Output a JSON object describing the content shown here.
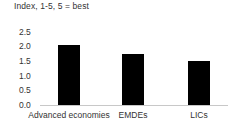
{
  "chart_data": {
    "type": "bar",
    "title": "Index, 1-5, 5 = best",
    "xlabel": "",
    "ylabel": "",
    "categories": [
      "Advanced economies",
      "EMDEs",
      "LICs"
    ],
    "values": [
      2.05,
      1.75,
      1.5
    ],
    "ylim": [
      0.0,
      2.5
    ],
    "yticks": [
      "0.0",
      "0.5",
      "1.0",
      "1.5",
      "2.0",
      "2.5"
    ],
    "ytick_values": [
      0.0,
      0.5,
      1.0,
      1.5,
      2.0,
      2.5
    ],
    "grid": false,
    "legend": null,
    "bar_color": "#000000",
    "axis_color": "#c8c8c8",
    "text_color": "#333333",
    "background": "#ffffff"
  }
}
